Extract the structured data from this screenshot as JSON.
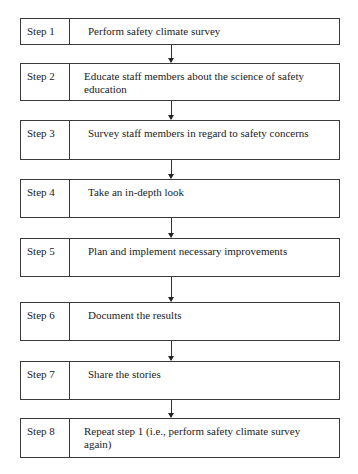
{
  "diagram": {
    "type": "flowchart",
    "direction": "top-to-bottom",
    "steps": [
      {
        "label": "Step 1",
        "text": "Perform safety climate survey"
      },
      {
        "label": "Step 2",
        "text": "Educate staff members about the science of safety education"
      },
      {
        "label": "Step 3",
        "text": "Survey staff members in regard to safety concerns"
      },
      {
        "label": "Step 4",
        "text": "Take an in-depth look"
      },
      {
        "label": "Step 5",
        "text": "Plan and implement necessary improvements"
      },
      {
        "label": "Step 6",
        "text": "Document the results"
      },
      {
        "label": "Step 7",
        "text": "Share the stories"
      },
      {
        "label": "Step 8",
        "text": "Repeat step 1 (i.e., perform safety climate survey again)"
      }
    ],
    "colors": {
      "border": "#3a3a3a",
      "background": "#ffffff",
      "text": "#222222"
    }
  }
}
